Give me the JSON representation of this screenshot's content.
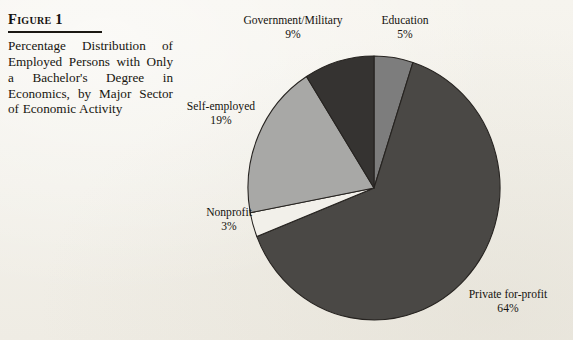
{
  "figure": {
    "title": "Figure 1",
    "caption": "Percentage Distribution of Employed Persons with Only a Bachelor's Degree in Economics, by Major Sector of Economic Activity"
  },
  "chart_data": {
    "type": "pie",
    "title": "Percentage Distribution of Employed Persons with Only a Bachelor's Degree in Economics, by Major Sector of Economic Activity",
    "xlabel": "",
    "ylabel": "",
    "units": "percent",
    "start_angle_deg": 0,
    "direction": "clockwise",
    "legend": "none-labels-outside",
    "grid": false,
    "categories": [
      "Education",
      "Private for-profit",
      "Nonprofit",
      "Self-employed",
      "Government/Military"
    ],
    "values": [
      5,
      64,
      3,
      19,
      9
    ],
    "slices": [
      {
        "label": "Education",
        "value": 5,
        "value_text": "5%",
        "color": "#7d7d7d",
        "start_deg": 0,
        "end_deg": 18
      },
      {
        "label": "Private for-profit",
        "value": 64,
        "value_text": "64%",
        "color": "#4a4845",
        "start_deg": 18,
        "end_deg": 248.4
      },
      {
        "label": "Nonprofit",
        "value": 3,
        "value_text": "3%",
        "color": "#f2f0ea",
        "start_deg": 248.4,
        "end_deg": 259.2
      },
      {
        "label": "Self-employed",
        "value": 19,
        "value_text": "19%",
        "color": "#a8a8a6",
        "start_deg": 259.2,
        "end_deg": 327.6
      },
      {
        "label": "Government/Military",
        "value": 9,
        "value_text": "9%",
        "color": "#353331",
        "start_deg": 327.6,
        "end_deg": 360
      }
    ],
    "geometry": {
      "center_x": 374,
      "center_y": 188,
      "radius_x": 126,
      "radius_y": 132
    }
  }
}
